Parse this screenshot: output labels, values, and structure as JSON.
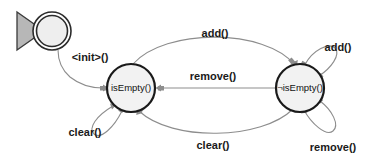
{
  "diagram": {
    "type": "uml-state-machine",
    "title": "",
    "background_color": "#ffffff",
    "edge_color": "#8d8d8d",
    "state_border_color": "#1a1a1a",
    "state_fill_color": "#f2f2f2",
    "start_fill_color": "#b7b7b7",
    "states": [
      {
        "id": "start",
        "kind": "initial-pseudostate",
        "label": "",
        "cx": 52,
        "cy": 31,
        "r": 19
      },
      {
        "id": "is-empty",
        "kind": "state",
        "label": "isEmpty()",
        "cx": 131,
        "cy": 88,
        "r": 24
      },
      {
        "id": "not-is-empty",
        "kind": "state",
        "label": "¬isEmpty()",
        "cx": 300,
        "cy": 88,
        "r": 24
      }
    ],
    "transitions": [
      {
        "id": "init-transition",
        "label": "<init>()",
        "from": "start",
        "to": "is-empty",
        "label_x": 90,
        "label_y": 58
      },
      {
        "id": "add-transition",
        "label": "add()",
        "from": "is-empty",
        "to": "not-is-empty",
        "label_x": 215,
        "label_y": 34
      },
      {
        "id": "remove-transition",
        "label": "remove()",
        "from": "not-is-empty",
        "to": "is-empty",
        "label_x": 213,
        "label_y": 77
      },
      {
        "id": "clear-transition",
        "label": "clear()",
        "from": "not-is-empty",
        "to": "is-empty",
        "label_x": 213,
        "label_y": 146
      },
      {
        "id": "clear-self-loop",
        "label": "clear()",
        "from": "is-empty",
        "to": "is-empty",
        "label_x": 85,
        "label_y": 133
      },
      {
        "id": "add-self-loop",
        "label": "add()",
        "from": "not-is-empty",
        "to": "not-is-empty",
        "label_x": 338,
        "label_y": 48
      },
      {
        "id": "remove-self-loop",
        "label": "remove()",
        "from": "not-is-empty",
        "to": "not-is-empty",
        "label_x": 333,
        "label_y": 148
      }
    ]
  }
}
